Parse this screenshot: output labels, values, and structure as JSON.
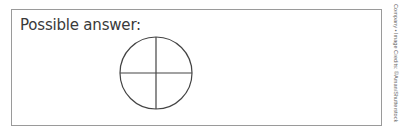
{
  "answer": {
    "label": "Possible answer:",
    "diagram": {
      "shape": "circle",
      "divisions": 4,
      "description": "circle divided into four equal parts by a vertical and a horizontal line"
    }
  },
  "credit": {
    "text": "Company • Image Credits: ©Aman/Shutterstock"
  },
  "colors": {
    "border": "#9a9a9a",
    "text": "#3a3a3a",
    "line": "#444444"
  }
}
